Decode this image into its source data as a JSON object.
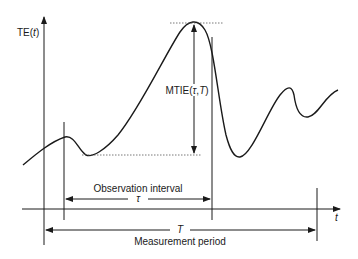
{
  "diagram": {
    "y_axis_label": {
      "prefix": "TE(",
      "var": "t",
      "suffix": ")"
    },
    "x_axis_label": "t",
    "mtie_label": {
      "prefix": "MTIE(",
      "tau": "τ",
      "sep": ",",
      "T": "T",
      "suffix": ")"
    },
    "observation_interval": {
      "label": "Observation interval",
      "symbol": "τ"
    },
    "measurement_period": {
      "label": "Measurement period",
      "symbol": "T"
    },
    "colors": {
      "line": "#1a1a1a",
      "dotted": "#555555",
      "background": "#ffffff"
    }
  }
}
